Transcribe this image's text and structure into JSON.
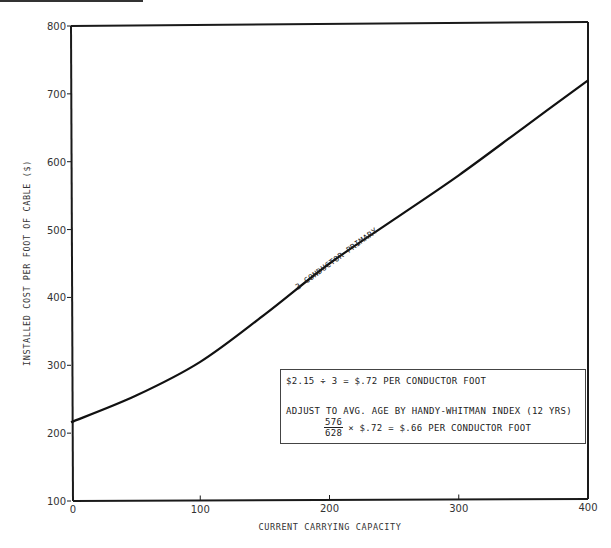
{
  "chart_data": {
    "type": "line",
    "title": "",
    "xlabel": "CURRENT CARRYING CAPACITY",
    "ylabel": "INSTALLED COST PER FOOT OF CABLE ($)",
    "xlim": [
      0,
      400
    ],
    "ylim": [
      100,
      800
    ],
    "x_ticks": [
      0,
      100,
      200,
      300,
      400
    ],
    "x_tick_labels": [
      "0",
      "100",
      "200",
      "300",
      "400"
    ],
    "y_ticks": [
      100,
      200,
      300,
      400,
      500,
      600,
      700,
      800
    ],
    "y_tick_labels": [
      "100",
      "200",
      "300",
      "400",
      "500",
      "600",
      "700",
      "800"
    ],
    "grid": false,
    "legend": "none",
    "series": [
      {
        "name": "3 CONDUCTOR PRIMARY",
        "x": [
          0,
          50,
          100,
          150,
          200,
          250,
          300,
          350,
          400
        ],
        "values": [
          216,
          255,
          305,
          375,
          450,
          515,
          580,
          650,
          720
        ]
      }
    ],
    "annotations": [
      "3 CONDUCTOR PRIMARY",
      "$2.15 ÷ 3 = $.72 PER CONDUCTOR FOOT",
      "ADJUST TO AVG. AGE BY HANDY-WHITMAN INDEX (12 YRS)",
      "576/628 × $.72 = $.66 PER CONDUCTOR FOOT"
    ]
  },
  "note": {
    "line1": "$2.15 ÷ 3 = $.72 PER CONDUCTOR FOOT",
    "line2": "ADJUST TO AVG. AGE BY HANDY-WHITMAN INDEX (12 YRS)",
    "frac_num": "576",
    "frac_den": "628",
    "line3_rest": "× $.72 = $.66 PER CONDUCTOR FOOT"
  },
  "curve_label": "3 CONDUCTOR PRIMARY",
  "colors": {
    "ink": "#1a1a1a",
    "paper": "#ffffff"
  }
}
